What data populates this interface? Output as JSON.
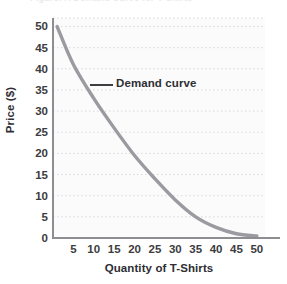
{
  "figure": {
    "clipped_header_text": "Figure: A Demand Curve for T-Shirts",
    "background_color": "#ffffff",
    "plot_background_color": "#fbfbfc",
    "axis_color": "#8d8d92",
    "grid_color": "#d8d8de",
    "curve_color": "#9a9aa0",
    "text_color": "#2e2e33"
  },
  "chart_data": {
    "type": "line",
    "title": "",
    "xlabel": "Quantity of T-Shirts",
    "ylabel": "Price ($)",
    "xlim": [
      0,
      52
    ],
    "ylim": [
      0,
      52
    ],
    "grid": true,
    "grid_style": "dotted",
    "legend": "none",
    "x_ticks": [
      5,
      10,
      15,
      20,
      25,
      30,
      35,
      40,
      45,
      50
    ],
    "x_tick_labels": [
      "5",
      "10",
      "15",
      "20",
      "25",
      "30",
      "35",
      "40",
      "45",
      "50"
    ],
    "y_ticks": [
      0,
      5,
      10,
      15,
      20,
      25,
      30,
      35,
      40,
      45,
      50
    ],
    "y_tick_labels": [
      "0",
      "5",
      "10",
      "15",
      "20",
      "25",
      "30",
      "35",
      "40",
      "45",
      "50"
    ],
    "series": [
      {
        "name": "Demand curve",
        "x": [
          1,
          5,
          10,
          15,
          20,
          25,
          30,
          35,
          40,
          45,
          50
        ],
        "y": [
          50,
          41,
          33,
          26,
          19.5,
          14,
          9,
          5,
          2.5,
          1,
          0.5
        ]
      }
    ],
    "annotations": [
      {
        "text": "Demand curve",
        "x": 16,
        "y": 37,
        "leader_line": true
      }
    ]
  },
  "axes": {
    "y_title": "Price ($)",
    "x_title": "Quantity of T-Shirts"
  },
  "annotation": {
    "label": "Demand curve"
  }
}
